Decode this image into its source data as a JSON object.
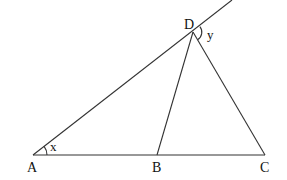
{
  "diagram": {
    "type": "geometry",
    "points": {
      "A": {
        "label": "A",
        "x": 33,
        "y": 155
      },
      "B": {
        "label": "B",
        "x": 157,
        "y": 155
      },
      "C": {
        "label": "C",
        "x": 265,
        "y": 155
      },
      "D": {
        "label": "D",
        "x": 193,
        "y": 32
      }
    },
    "segments": [
      "AB",
      "BC",
      "AD",
      "BD",
      "CD"
    ],
    "rays": [
      {
        "from": "A",
        "through": "D",
        "extends_to": {
          "x": 232,
          "y": 0
        }
      }
    ],
    "angles": {
      "x": {
        "label": "x",
        "vertex": "A",
        "between": [
          "AC",
          "AD"
        ]
      },
      "y": {
        "label": "y",
        "vertex": "D",
        "between": [
          "D-extension",
          "DC"
        ]
      }
    },
    "line_color": "#333333"
  }
}
